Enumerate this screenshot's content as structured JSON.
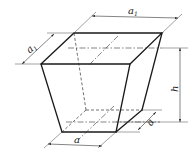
{
  "diagram": {
    "labels": {
      "top_length": "a",
      "top_length_sub": "1",
      "top_width": "a",
      "top_width_sub": "1",
      "height": "h",
      "bottom_width": "a",
      "bottom_length": "a"
    },
    "colors": {
      "line": "#1a1a1a",
      "background": "#ffffff"
    }
  }
}
